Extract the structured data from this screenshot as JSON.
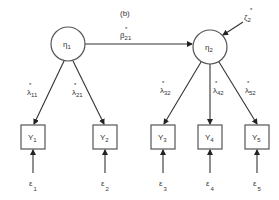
{
  "panel_label": "(b)",
  "latent": [
    {
      "id": "eta1",
      "symbol": "η",
      "sub": "1",
      "cx": 68,
      "cy": 44,
      "r": 17
    },
    {
      "id": "eta2",
      "symbol": "η",
      "sub": "2",
      "cx": 210,
      "cy": 47,
      "r": 17
    }
  ],
  "structural_path": {
    "symbol": "β",
    "sub": "21",
    "mark": "*"
  },
  "disturbance": {
    "symbol": "ζ",
    "sub": "2",
    "mark": "*"
  },
  "observed": [
    {
      "id": "Y1",
      "symbol": "Y",
      "sub": "1",
      "x": 21
    },
    {
      "id": "Y2",
      "symbol": "Y",
      "sub": "2",
      "x": 93
    },
    {
      "id": "Y3",
      "symbol": "Y",
      "sub": "3",
      "x": 151
    },
    {
      "id": "Y4",
      "symbol": "Y",
      "sub": "4",
      "x": 198
    },
    {
      "id": "Y5",
      "symbol": "Y",
      "sub": "5",
      "x": 245
    }
  ],
  "loadings": [
    {
      "symbol": "λ",
      "sub": "11",
      "mark": "*"
    },
    {
      "symbol": "λ",
      "sub": "21",
      "mark": "*"
    },
    {
      "symbol": "λ",
      "sub": "32",
      "mark": "*"
    },
    {
      "symbol": "λ",
      "sub": "42",
      "mark": "*"
    },
    {
      "symbol": "λ",
      "sub": "52",
      "mark": "*"
    }
  ],
  "errors": [
    {
      "symbol": "ε",
      "sub": "1"
    },
    {
      "symbol": "ε",
      "sub": "2"
    },
    {
      "symbol": "ε",
      "sub": "3"
    },
    {
      "symbol": "ε",
      "sub": "4"
    },
    {
      "symbol": "ε",
      "sub": "5"
    }
  ]
}
